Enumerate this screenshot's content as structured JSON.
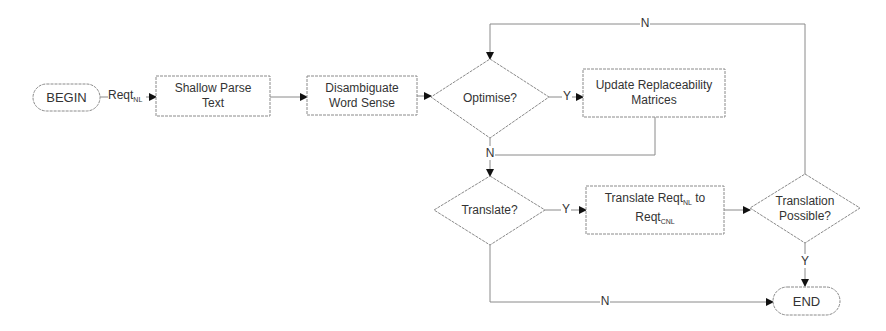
{
  "diagram": {
    "type": "flowchart",
    "colors": {
      "stroke": "#8a8a8a",
      "text": "#333333",
      "background": "#ffffff"
    },
    "nodes": {
      "begin": {
        "label": "BEGIN",
        "shape": "terminator"
      },
      "shallow_parse": {
        "line1": "Shallow Parse",
        "line2": "Text",
        "shape": "process"
      },
      "disambiguate": {
        "line1": "Disambiguate",
        "line2": "Word Sense",
        "shape": "process"
      },
      "optimise": {
        "label": "Optimise?",
        "shape": "decision"
      },
      "update": {
        "line1": "Update Replaceability",
        "line2": "Matrices",
        "shape": "process"
      },
      "translate_q": {
        "label": "Translate?",
        "shape": "decision"
      },
      "translate_box": {
        "pre": "Translate Reqt",
        "sub1": "NL",
        "post": " to",
        "line2": "Reqt",
        "sub2": "CNL",
        "shape": "process"
      },
      "possible": {
        "line1": "Translation",
        "line2": "Possible?",
        "shape": "decision"
      },
      "end": {
        "label": "END",
        "shape": "terminator"
      }
    },
    "edges": {
      "begin_to_parse": {
        "label": "Reqt",
        "sub": "NL"
      },
      "optimise_yes": {
        "label": "Y"
      },
      "optimise_no": {
        "label": "N"
      },
      "translate_yes": {
        "label": "Y"
      },
      "translate_no": {
        "label": "N"
      },
      "possible_yes": {
        "label": "Y"
      },
      "possible_no": {
        "label": "N"
      }
    }
  }
}
